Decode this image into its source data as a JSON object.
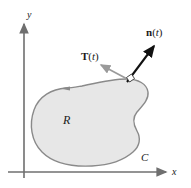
{
  "figure": {
    "colors": {
      "region_fill": "#e7e7e7",
      "curve_stroke": "#8a8a8a",
      "tangent_vector": "#9a9a9a",
      "normal_vector": "#111111",
      "axis": "#6f6f6f",
      "text": "#1a1a1a"
    },
    "axes": {
      "x_label": "x",
      "y_label": "y",
      "origin": {
        "x": 24,
        "y": 172
      },
      "x_axis_end": {
        "x": 168,
        "y": 172
      },
      "y_axis_end": {
        "x": 24,
        "y": 22
      }
    },
    "labels": {
      "region": "R",
      "curve": "C",
      "tangent_bold": "T",
      "tangent_arg_open": "(",
      "tangent_arg_var": "t",
      "tangent_arg_close": ")",
      "normal_bold": "n",
      "normal_arg_open": "(",
      "normal_arg_var": "t",
      "normal_arg_close": ")"
    },
    "vectors": {
      "tangent": {
        "name": "T(t)",
        "from": {
          "x": 131,
          "y": 81
        },
        "to": {
          "x": 99,
          "y": 64
        },
        "color": "#9a9a9a"
      },
      "normal": {
        "name": "n(t)",
        "from": {
          "x": 127,
          "y": 82
        },
        "to": {
          "x": 156,
          "y": 43
        },
        "color": "#111111"
      }
    },
    "orientation_marker": {
      "description": "counterclockwise direction arrowhead on curve",
      "position": {
        "x": 66,
        "y": 88
      }
    },
    "right_angle_marker": {
      "description": "right angle between T(t) and n(t)",
      "position": {
        "x": 130,
        "y": 79
      }
    }
  }
}
